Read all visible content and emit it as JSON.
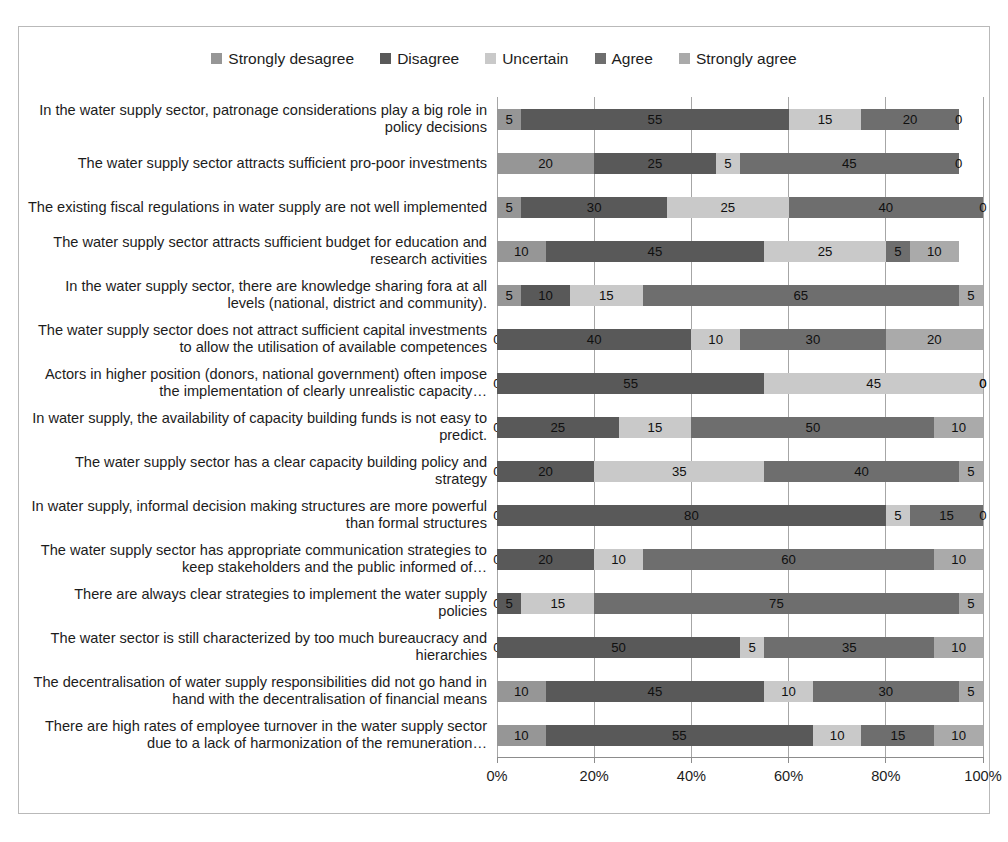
{
  "chart_data": {
    "type": "bar",
    "orientation": "horizontal",
    "stacked": true,
    "stacked_mode": "percent",
    "title": "",
    "subtitle": "",
    "xlabel": "",
    "ylabel": "",
    "xlim": [
      0,
      100
    ],
    "xticks": [
      "0%",
      "20%",
      "40%",
      "60%",
      "80%",
      "100%"
    ],
    "xtick_values": [
      0,
      20,
      40,
      60,
      80,
      100
    ],
    "grid": true,
    "legend_position": "top-center",
    "series": [
      {
        "name": "Strongly desagree",
        "color": "#969696",
        "values": [
          5,
          20,
          5,
          10,
          5,
          0,
          0,
          0,
          0,
          0,
          0,
          0,
          0,
          10,
          10
        ]
      },
      {
        "name": "Disagree",
        "color": "#595959",
        "values": [
          55,
          25,
          30,
          45,
          10,
          40,
          55,
          25,
          20,
          80,
          20,
          5,
          50,
          45,
          55
        ]
      },
      {
        "name": "Uncertain",
        "color": "#c9c9c9",
        "values": [
          15,
          5,
          25,
          25,
          15,
          10,
          45,
          15,
          35,
          5,
          10,
          15,
          5,
          10,
          10
        ]
      },
      {
        "name": "Agree",
        "color": "#6e6e6e",
        "values": [
          20,
          45,
          40,
          5,
          65,
          30,
          0,
          50,
          40,
          15,
          60,
          75,
          35,
          30,
          15
        ]
      },
      {
        "name": "Strongly agree",
        "color": "#aaaaaa",
        "values": [
          0,
          0,
          0,
          10,
          5,
          20,
          0,
          10,
          5,
          0,
          10,
          5,
          10,
          5,
          10
        ]
      }
    ],
    "categories": [
      "In the water supply sector, patronage considerations play a big role in policy decisions",
      "The water supply sector attracts sufficient pro-poor investments",
      "The existing fiscal regulations in water supply are not well implemented",
      "The water supply sector attracts sufficient budget for education and research activities",
      "In the water supply sector, there are knowledge sharing fora at all levels (national, district and community).",
      "The water supply sector does not attract sufficient capital investments to allow the utilisation of available competences",
      "Actors in higher position (donors, national government) often impose the implementation of clearly unrealistic capacity…",
      "In water supply, the availability of capacity building funds is not easy to predict.",
      "The water supply sector has a clear capacity building policy and strategy",
      "In water supply, informal decision making structures are more powerful than formal structures",
      "The water supply sector has appropriate communication strategies to keep stakeholders and the public informed of…",
      "There are always clear strategies to implement the water supply policies",
      "The water sector is still characterized by too much bureaucracy and hierarchies",
      "The decentralisation of water supply responsibilities did not go hand in hand with the decentralisation of financial means",
      "There are high rates of employee turnover in the water supply sector due to a lack of harmonization of the remuneration…"
    ]
  }
}
